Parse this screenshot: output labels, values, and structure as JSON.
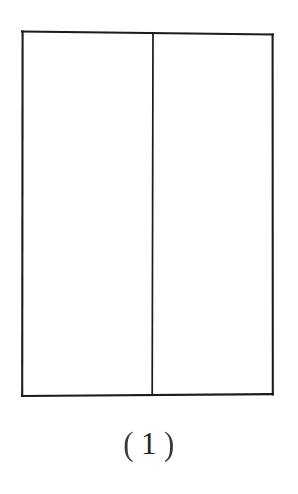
{
  "figure": {
    "caption": "（1）",
    "caption_parts": {
      "open_paren": "(",
      "number": "1",
      "close_paren": ")"
    },
    "kind": "line-drawing",
    "colors": {
      "background": "#ffffff",
      "stroke": "#1a1a1a",
      "caption_text": "#2a2a2a"
    },
    "outer_rectangle": {
      "left": 22,
      "top": 31,
      "right": 273,
      "bottom": 396,
      "width": 251,
      "height": 365,
      "stroke_width": 2
    },
    "divider": {
      "name": "vertical-divider",
      "x": 152.5,
      "top": 31,
      "bottom": 396,
      "stroke_width": 1.8
    },
    "panels": [
      {
        "name": "left-panel",
        "left": 22,
        "right": 152.5,
        "width": 130.5
      },
      {
        "name": "right-panel",
        "left": 152.5,
        "right": 273,
        "width": 120.5
      }
    ]
  }
}
